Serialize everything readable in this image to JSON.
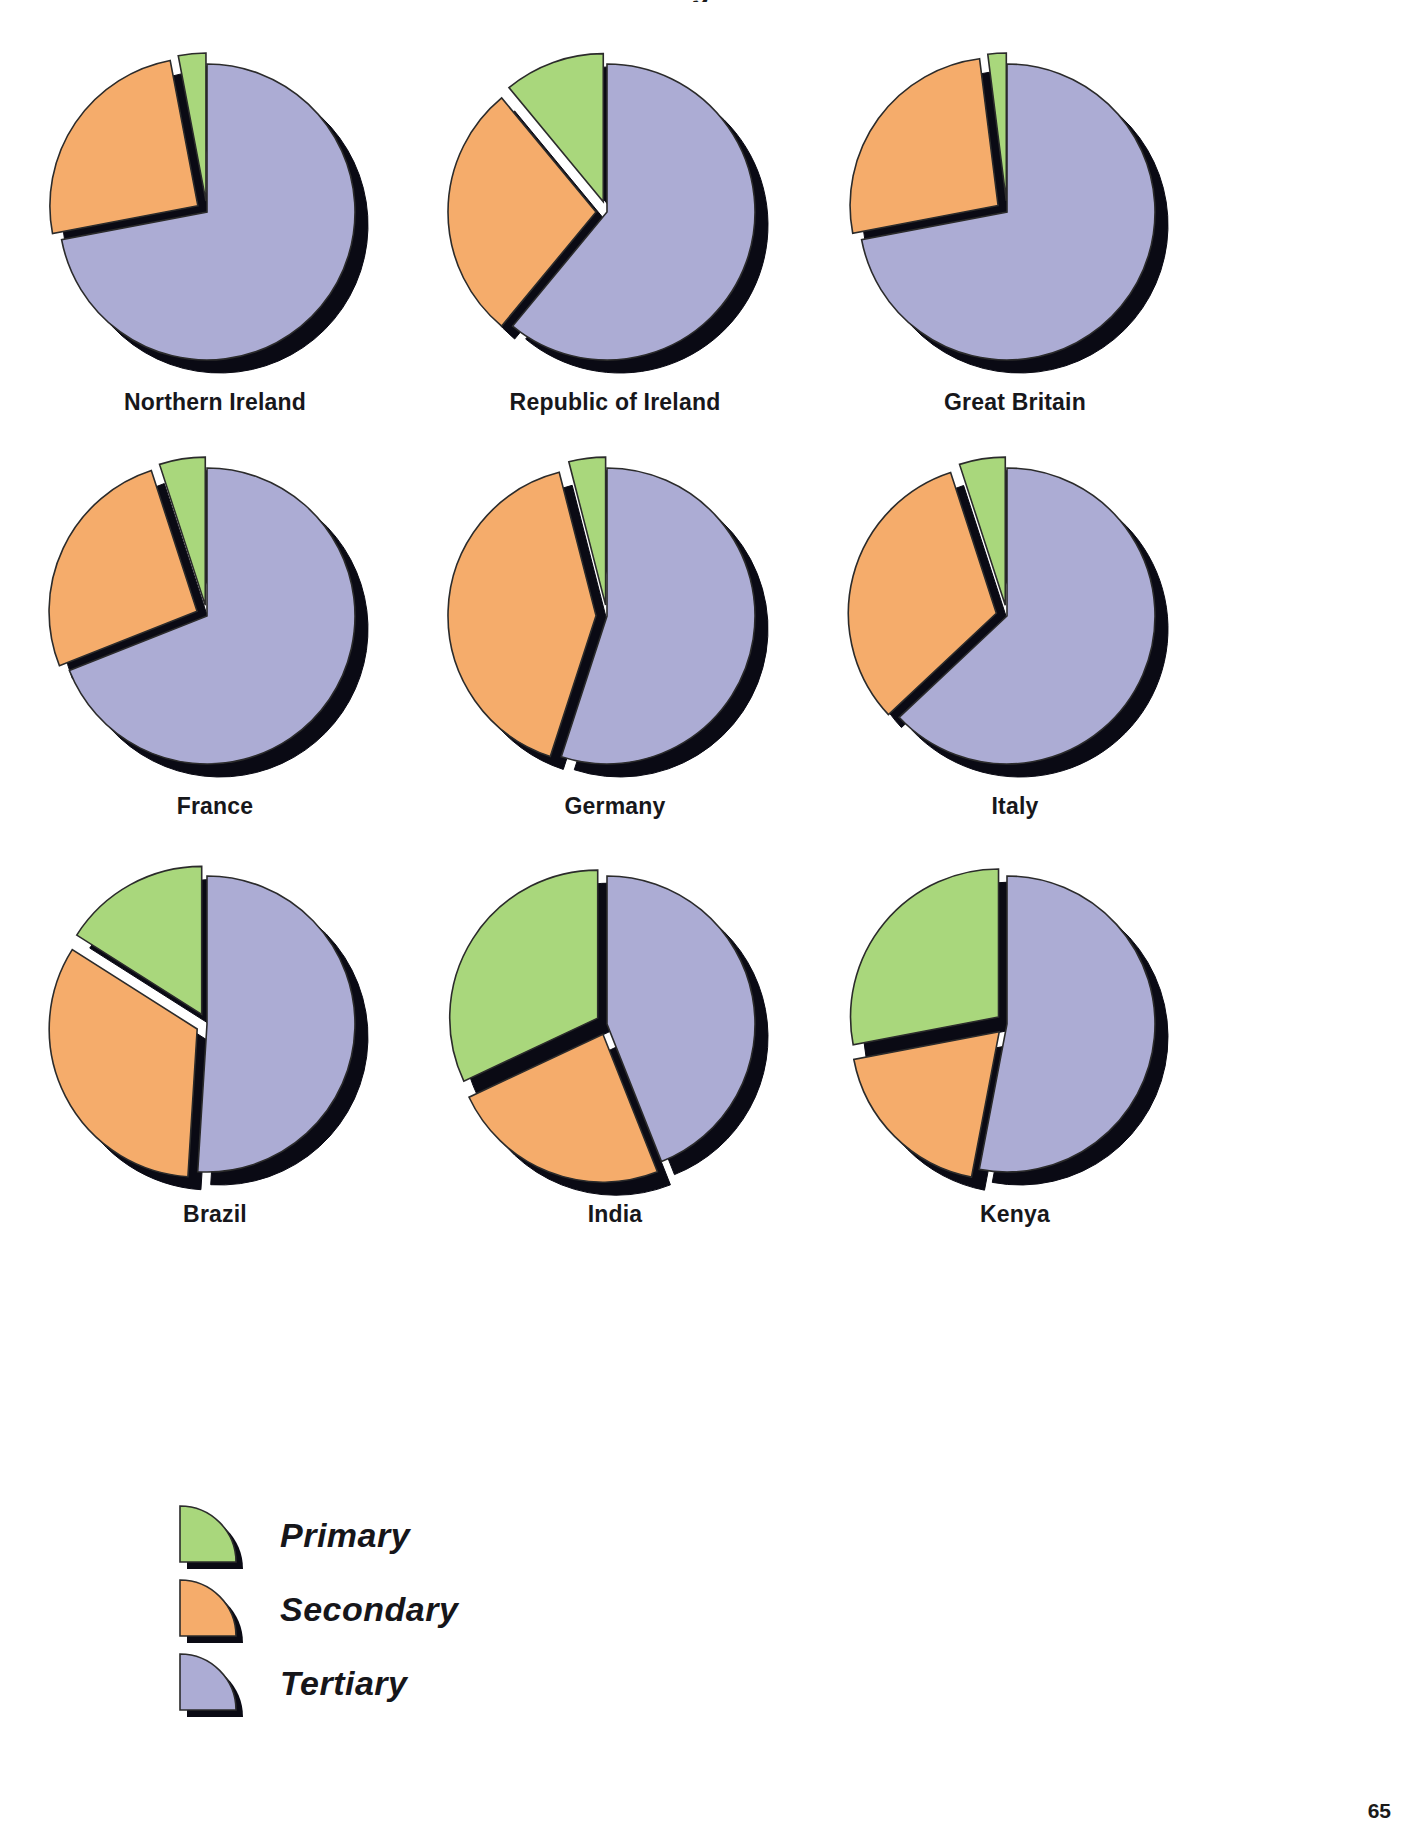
{
  "page": {
    "clipped_heading": "g",
    "page_number": "65",
    "background": "#ffffff"
  },
  "colors": {
    "primary": "#a9d77c",
    "secondary": "#f5ac6b",
    "tertiary": "#acacd4",
    "outline": "#000000",
    "shadow": "#0a0a14",
    "label_text": "#17171b"
  },
  "legend": {
    "title": "",
    "items": [
      {
        "label": "Primary",
        "color": "#a9d77c",
        "swatch": "pie-wedge-icon"
      },
      {
        "label": "Secondary",
        "color": "#f5ac6b",
        "swatch": "pie-wedge-icon"
      },
      {
        "label": "Tertiary",
        "color": "#acacd4",
        "swatch": "pie-wedge-icon"
      }
    ]
  },
  "chart_data": {
    "type": "pie",
    "title": "",
    "legend_position": "bottom-left",
    "series_names": [
      "Primary",
      "Secondary",
      "Tertiary"
    ],
    "series_colors": [
      "#a9d77c",
      "#f5ac6b",
      "#acacd4"
    ],
    "units": "percent of workforce",
    "charts": [
      {
        "title": "Northern Ireland",
        "categories": [
          "Primary",
          "Secondary",
          "Tertiary"
        ],
        "values": [
          3,
          25,
          72
        ]
      },
      {
        "title": "Republic of Ireland",
        "categories": [
          "Primary",
          "Secondary",
          "Tertiary"
        ],
        "values": [
          11,
          28,
          61
        ]
      },
      {
        "title": "Great Britain",
        "categories": [
          "Primary",
          "Secondary",
          "Tertiary"
        ],
        "values": [
          2,
          26,
          72
        ]
      },
      {
        "title": "France",
        "categories": [
          "Primary",
          "Secondary",
          "Tertiary"
        ],
        "values": [
          5,
          26,
          69
        ]
      },
      {
        "title": "Germany",
        "categories": [
          "Primary",
          "Secondary",
          "Tertiary"
        ],
        "values": [
          4,
          41,
          55
        ]
      },
      {
        "title": "Italy",
        "categories": [
          "Primary",
          "Secondary",
          "Tertiary"
        ],
        "values": [
          5,
          32,
          63
        ]
      },
      {
        "title": "Brazil",
        "categories": [
          "Primary",
          "Secondary",
          "Tertiary"
        ],
        "values": [
          16,
          33,
          51
        ]
      },
      {
        "title": "India",
        "categories": [
          "Primary",
          "Secondary",
          "Tertiary"
        ],
        "values": [
          32,
          24,
          44
        ]
      },
      {
        "title": "Kenya",
        "categories": [
          "Primary",
          "Secondary",
          "Tertiary"
        ],
        "values": [
          28,
          19,
          53
        ]
      }
    ]
  },
  "rows": [
    {
      "cells": [
        0,
        1,
        2
      ]
    },
    {
      "cells": [
        3,
        4,
        5
      ]
    },
    {
      "cells": [
        6,
        7,
        8
      ]
    }
  ]
}
